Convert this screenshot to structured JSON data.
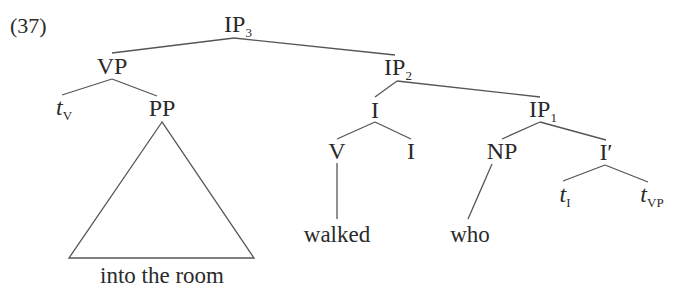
{
  "example_number": "(37)",
  "nodes": {
    "ip3": {
      "label": "IP",
      "sub": "3"
    },
    "vp": {
      "label": "VP"
    },
    "tv": {
      "label": "t",
      "sub": "V"
    },
    "pp": {
      "label": "PP"
    },
    "pp_text": {
      "label": "into the room"
    },
    "ip2": {
      "label": "IP",
      "sub": "2"
    },
    "i_upper": {
      "label": "I"
    },
    "v": {
      "label": "V"
    },
    "i_lower": {
      "label": "I"
    },
    "walked": {
      "label": "walked"
    },
    "ip1": {
      "label": "IP",
      "sub": "1"
    },
    "np": {
      "label": "NP"
    },
    "who": {
      "label": "who"
    },
    "ibar": {
      "label": "I′"
    },
    "ti": {
      "label": "t",
      "sub": "I"
    },
    "tvp": {
      "label": "t",
      "sub": "VP"
    }
  },
  "colors": {
    "line": "#555555",
    "text": "#2a2a2a"
  }
}
